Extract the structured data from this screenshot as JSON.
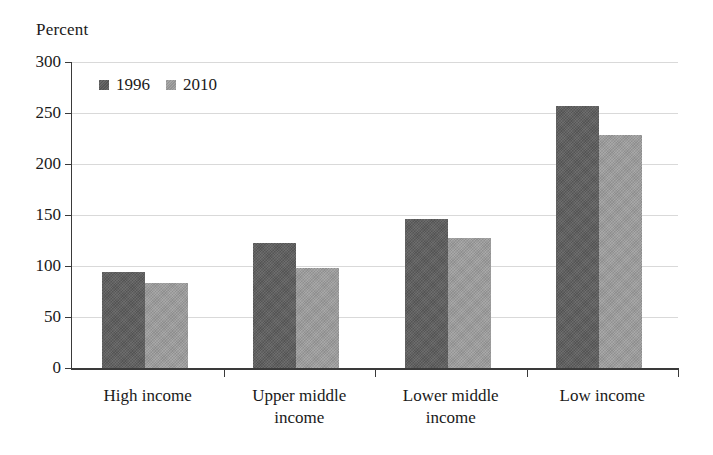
{
  "chart_data": {
    "type": "bar",
    "title": "",
    "ylabel": "Percent",
    "xlabel": "",
    "ylim": [
      0,
      300
    ],
    "yticks": [
      0,
      50,
      100,
      150,
      200,
      250,
      300
    ],
    "ytick_labels": [
      "0",
      "50",
      "100",
      "150",
      "200",
      "250",
      "300"
    ],
    "grid": true,
    "legend_position": "top-left",
    "categories": [
      "High income",
      "Upper middle\nincome",
      "Lower middle\nincome",
      "Low income"
    ],
    "series": [
      {
        "name": "1996",
        "color": "#5d5d5d",
        "values": [
          94,
          123,
          146,
          257
        ]
      },
      {
        "name": "2010",
        "color": "#9c9c9c",
        "values": [
          83,
          98,
          127,
          228
        ]
      }
    ]
  },
  "colors": {
    "series_1996": "#5d5d5d",
    "series_2010": "#9c9c9c",
    "axis": "#3a3a3a",
    "gridline": "#d9d9d9",
    "background": "#ffffff",
    "text": "#1a1a1a"
  }
}
